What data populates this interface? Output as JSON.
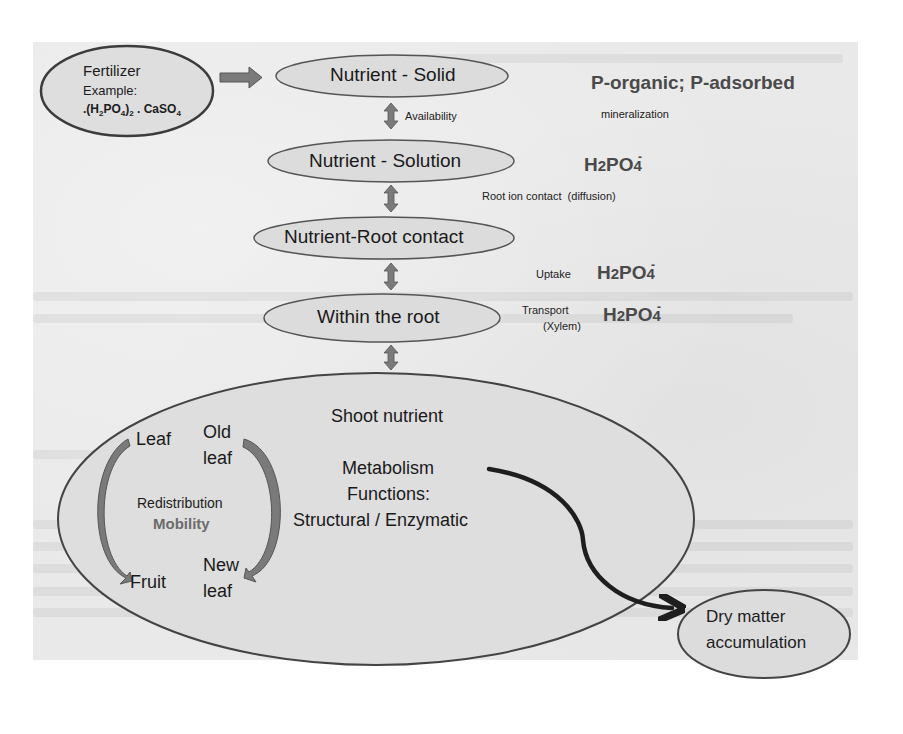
{
  "diagram": {
    "fertilizer": {
      "title": "Fertilizer",
      "subtitle": "Example:",
      "formula_prefix": ".(H",
      "formula_sub1": "2",
      "formula_mid": "PO",
      "formula_sub2": "4",
      "formula_close": ")",
      "formula_sub3": "2",
      "formula_tail": " . CaSO",
      "formula_sub4": "4"
    },
    "nodes": {
      "nutrient_solid": "Nutrient - Solid",
      "nutrient_solution": "Nutrient - Solution",
      "nutrient_root_contact": "Nutrient-Root contact",
      "within_root": "Within the root",
      "dry_matter_line1": "Dry matter",
      "dry_matter_line2": "accumulation"
    },
    "edge_labels": {
      "availability": "Availability",
      "mineralization": "mineralization",
      "root_ion_contact": "Root ion contact  (diffusion)",
      "uptake": "Uptake",
      "transport": "Transport",
      "xylem": "(Xylem)"
    },
    "side_notes": {
      "p_forms": "P-organic; P-adsorbed",
      "ion_h": "H",
      "ion_2": "2",
      "ion_po": "PO",
      "ion_4": "4",
      "ion_charge": "-"
    },
    "shoot": {
      "title": "Shoot nutrient",
      "metabolism": "Metabolism",
      "functions": "Functions:",
      "structural": "Structural / Enzymatic",
      "leaf": "Leaf",
      "old": "Old",
      "old_leaf": "leaf",
      "fruit": "Fruit",
      "new": "New",
      "new_leaf": "leaf",
      "redistribution": "Redistribution",
      "mobility": "Mobility"
    },
    "colors": {
      "ellipse_fill": "#dcdcdc",
      "ellipse_stroke": "#4a4a4a",
      "arrow_fill": "#7a7a7a",
      "paper": "#e9e9e9",
      "mobility_text": "#6b6b6b"
    }
  }
}
